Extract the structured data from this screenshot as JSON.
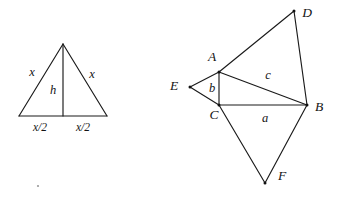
{
  "figure": {
    "background_color": "#ffffff",
    "line_color": "#1a1a1a",
    "text_color": "#141414",
    "left_diagram": {
      "name": "isosceles-triangle-with-altitude",
      "vertices": {
        "apex": {
          "x": 63,
          "y": 44
        },
        "base_left": {
          "x": 19,
          "y": 116
        },
        "base_right": {
          "x": 107,
          "y": 116
        },
        "base_mid": {
          "x": 63,
          "y": 116
        }
      },
      "edges": [
        {
          "name": "left-leg",
          "from": "base_left",
          "to": "apex"
        },
        {
          "name": "right-leg",
          "from": "apex",
          "to": "base_right"
        },
        {
          "name": "base",
          "from": "base_left",
          "to": "base_right"
        },
        {
          "name": "altitude",
          "from": "apex",
          "to": "base_mid"
        }
      ],
      "labels": [
        {
          "name": "left-leg-label",
          "text": "x",
          "x": 32,
          "y": 73
        },
        {
          "name": "right-leg-label",
          "text": "x",
          "x": 92,
          "y": 75
        },
        {
          "name": "altitude-label",
          "text": "h",
          "x": 53,
          "y": 91
        },
        {
          "name": "base-left-half-label",
          "text": "x/2",
          "x": 40,
          "y": 128
        },
        {
          "name": "base-right-half-label",
          "text": "x/2",
          "x": 83,
          "y": 128
        }
      ]
    },
    "right_diagram": {
      "name": "composite-triangle-figure-abcdef",
      "vertices": {
        "A": {
          "x": 219,
          "y": 72
        },
        "B": {
          "x": 307,
          "y": 105
        },
        "C": {
          "x": 219,
          "y": 105
        },
        "D": {
          "x": 294,
          "y": 11
        },
        "E": {
          "x": 190,
          "y": 87
        },
        "F": {
          "x": 265,
          "y": 183
        }
      },
      "edges": [
        {
          "name": "edge-A-D",
          "from": "A",
          "to": "D"
        },
        {
          "name": "edge-D-B",
          "from": "D",
          "to": "B"
        },
        {
          "name": "edge-A-B",
          "from": "A",
          "to": "B"
        },
        {
          "name": "edge-A-C",
          "from": "A",
          "to": "C"
        },
        {
          "name": "edge-C-B",
          "from": "C",
          "to": "B"
        },
        {
          "name": "edge-A-E",
          "from": "A",
          "to": "E"
        },
        {
          "name": "edge-E-C",
          "from": "E",
          "to": "C"
        },
        {
          "name": "edge-C-F",
          "from": "C",
          "to": "F"
        },
        {
          "name": "edge-F-B",
          "from": "F",
          "to": "B"
        }
      ],
      "point_labels": [
        {
          "name": "point-label-D",
          "text": "D",
          "x": 307,
          "y": 14
        },
        {
          "name": "point-label-A",
          "text": "A",
          "x": 212,
          "y": 58
        },
        {
          "name": "point-label-E",
          "text": "E",
          "x": 174,
          "y": 87
        },
        {
          "name": "point-label-B",
          "text": "B",
          "x": 319,
          "y": 108
        },
        {
          "name": "point-label-C",
          "text": "C",
          "x": 214,
          "y": 116
        },
        {
          "name": "point-label-F",
          "text": "F",
          "x": 282,
          "y": 177
        }
      ],
      "side_labels": [
        {
          "name": "side-label-c",
          "text": "c",
          "x": 268,
          "y": 76
        },
        {
          "name": "side-label-b",
          "text": "b",
          "x": 212,
          "y": 89
        },
        {
          "name": "side-label-a",
          "text": "a",
          "x": 265,
          "y": 119
        }
      ]
    },
    "speck": {
      "name": "stray-speck",
      "x": 38,
      "y": 186
    }
  }
}
